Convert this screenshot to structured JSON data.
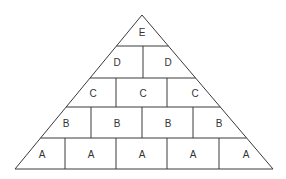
{
  "diagram": {
    "type": "pyramid",
    "line_color": "#3a3a3a",
    "text_color": "#333333",
    "background": "#ffffff",
    "levels": [
      {
        "level": "E",
        "blocks": [
          "E"
        ]
      },
      {
        "level": "D",
        "blocks": [
          "D",
          "D"
        ]
      },
      {
        "level": "C",
        "blocks": [
          "C",
          "C",
          "C"
        ]
      },
      {
        "level": "B",
        "blocks": [
          "B",
          "B",
          "B",
          "B"
        ]
      },
      {
        "level": "A",
        "blocks": [
          "A",
          "A",
          "A",
          "A",
          "A"
        ]
      }
    ]
  }
}
